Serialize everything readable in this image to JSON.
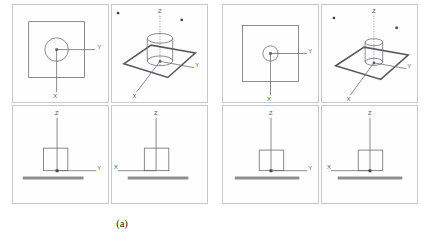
{
  "figure": {
    "panels": [
      {
        "id": "a",
        "caption": "(a)",
        "views": [
          {
            "name": "top-view",
            "position": "top-left",
            "type": "orthographic-top",
            "axes": [
              {
                "label": "Y",
                "direction": "right"
              },
              {
                "label": "X",
                "direction": "down"
              }
            ],
            "shapes": [
              {
                "kind": "square-outline",
                "label": "plate-outline"
              },
              {
                "kind": "circle-outline",
                "label": "cylinder-section",
                "relative_radius": 0.21
              }
            ]
          },
          {
            "name": "isometric-view",
            "position": "top-right",
            "type": "isometric-3d",
            "axes": [
              {
                "label": "Z",
                "direction": "up",
                "style": "dotted"
              },
              {
                "label": "Y",
                "direction": "right"
              },
              {
                "label": "X",
                "direction": "down-left"
              }
            ],
            "shapes": [
              {
                "kind": "plate",
                "label": "ground-plate"
              },
              {
                "kind": "cylinder",
                "label": "column",
                "relative_radius": 0.3
              }
            ],
            "markers": [
              {
                "label": "corner-marker-left"
              },
              {
                "label": "corner-marker-right"
              }
            ]
          },
          {
            "name": "front-elevation",
            "position": "bottom-left",
            "type": "orthographic-front",
            "axes": [
              {
                "label": "Z",
                "direction": "up"
              },
              {
                "label": "Y",
                "direction": "right"
              }
            ],
            "shapes": [
              {
                "kind": "rectangle-outline",
                "label": "column-profile"
              },
              {
                "kind": "thick-bar",
                "label": "ground-plane"
              },
              {
                "kind": "origin-marker",
                "label": "origin"
              }
            ]
          },
          {
            "name": "side-elevation",
            "position": "bottom-right",
            "type": "orthographic-side",
            "axes": [
              {
                "label": "Z",
                "direction": "up"
              },
              {
                "label": "X",
                "direction": "left"
              }
            ],
            "shapes": [
              {
                "kind": "rectangle-outline",
                "label": "column-profile"
              },
              {
                "kind": "thick-bar",
                "label": "ground-plane"
              }
            ]
          }
        ]
      },
      {
        "id": "b",
        "caption": "(b)",
        "views": [
          {
            "name": "top-view",
            "position": "top-left",
            "type": "orthographic-top",
            "axes": [
              {
                "label": "Y",
                "direction": "right"
              },
              {
                "label": "X",
                "direction": "down"
              }
            ],
            "shapes": [
              {
                "kind": "square-outline",
                "label": "plate-outline"
              },
              {
                "kind": "circle-outline",
                "label": "cylinder-section",
                "relative_radius": 0.13
              }
            ]
          },
          {
            "name": "isometric-view",
            "position": "top-right",
            "type": "isometric-3d",
            "axes": [
              {
                "label": "Z",
                "direction": "up",
                "style": "dotted"
              },
              {
                "label": "Y",
                "direction": "right"
              },
              {
                "label": "X",
                "direction": "down-left"
              }
            ],
            "shapes": [
              {
                "kind": "plate",
                "label": "ground-plate"
              },
              {
                "kind": "cylinder",
                "label": "column",
                "relative_radius": 0.19
              }
            ],
            "markers": [
              {
                "label": "corner-marker-left"
              },
              {
                "label": "corner-marker-right"
              }
            ]
          },
          {
            "name": "front-elevation",
            "position": "bottom-left",
            "type": "orthographic-front",
            "axes": [
              {
                "label": "Z",
                "direction": "up"
              },
              {
                "label": "Y",
                "direction": "right"
              }
            ],
            "shapes": [
              {
                "kind": "rectangle-outline",
                "label": "column-profile"
              },
              {
                "kind": "thick-bar",
                "label": "ground-plane"
              },
              {
                "kind": "origin-marker",
                "label": "origin"
              }
            ]
          },
          {
            "name": "side-elevation",
            "position": "bottom-right",
            "type": "orthographic-side",
            "axes": [
              {
                "label": "Z",
                "direction": "up"
              },
              {
                "label": "X",
                "direction": "left"
              }
            ],
            "shapes": [
              {
                "kind": "rectangle-outline",
                "label": "column-profile"
              },
              {
                "kind": "thick-bar",
                "label": "ground-plane"
              },
              {
                "kind": "origin-marker",
                "label": "origin"
              }
            ]
          }
        ]
      }
    ],
    "axis_labels": {
      "x": "X",
      "y": "Y",
      "z": "Z"
    },
    "colors": {
      "geometry_line": "#6b6b72",
      "heavy_line": "#57575d",
      "ground_bar": "#8d8d93",
      "viewport_border": "#c9c9c9",
      "axis_text": "#55555a",
      "caption_text": "#141414",
      "background": "#ffffff"
    }
  }
}
